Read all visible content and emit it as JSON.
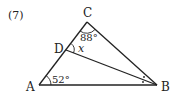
{
  "problem_number": "(7)",
  "points": {
    "A": {
      "label": "A",
      "x": 39,
      "y": 85
    },
    "B": {
      "label": "B",
      "x": 157,
      "y": 85
    },
    "C": {
      "label": "C",
      "x": 87,
      "y": 22
    },
    "D": {
      "label": "D",
      "x": 66,
      "y": 50
    }
  },
  "angles": {
    "A": "52°",
    "C": "88°",
    "x": "x"
  },
  "colors": {
    "line": "#222222",
    "background": "#ffffff"
  }
}
